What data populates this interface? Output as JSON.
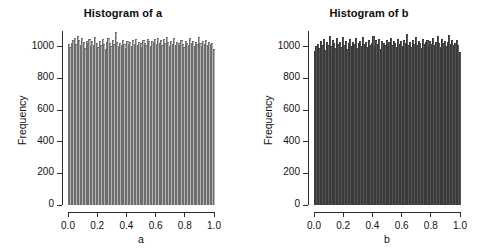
{
  "figure": {
    "background": "#ffffff",
    "width": 492,
    "height": 250,
    "panel_count": 2
  },
  "chart_data": [
    {
      "type": "bar",
      "subtype": "histogram",
      "title": "Histogram of a",
      "xlabel": "a",
      "ylabel": "Frequency",
      "xlim": [
        0.0,
        1.0
      ],
      "ylim": [
        0,
        1100
      ],
      "xticks": [
        "0.0",
        "0.2",
        "0.4",
        "0.6",
        "0.8",
        "1.0"
      ],
      "xtick_values": [
        0.0,
        0.2,
        0.4,
        0.6,
        0.8,
        1.0
      ],
      "yticks": [
        "0",
        "200",
        "400",
        "600",
        "800",
        "1000"
      ],
      "ytick_values": [
        0,
        200,
        400,
        600,
        800,
        1000
      ],
      "grid": false,
      "legend": null,
      "bar_fill": "#b4b4b4",
      "bar_edge": "#6e6e6e",
      "bin_width": 0.01,
      "n_bins": 100,
      "values": [
        1010,
        995,
        1020,
        1038,
        1052,
        1012,
        1060,
        1035,
        1004,
        1048,
        1022,
        986,
        1028,
        1015,
        1043,
        1001,
        1030,
        1008,
        1055,
        1018,
        994,
        1032,
        1007,
        1041,
        1013,
        981,
        1026,
        1049,
        1016,
        1002,
        1036,
        1010,
        1088,
        1024,
        999,
        1021,
        1005,
        1040,
        1014,
        988,
        1031,
        1009,
        1023,
        996,
        1034,
        1011,
        1046,
        1003,
        1027,
        1019,
        992,
        1037,
        1017,
        1006,
        1042,
        1029,
        1000,
        1033,
        1025,
        1045,
        1012,
        1051,
        1020,
        1039,
        1008,
        1044,
        1016,
        1056,
        1022,
        998,
        1030,
        1013,
        1047,
        1005,
        1026,
        1018,
        1003,
        1035,
        1011,
        990,
        1028,
        1021,
        1007,
        1050,
        1015,
        1032,
        1002,
        1024,
        1009,
        1058,
        1019,
        1001,
        1029,
        1014,
        1040,
        1006,
        1023,
        1010,
        1017,
        978
      ]
    },
    {
      "type": "bar",
      "subtype": "histogram",
      "title": "Histogram of b",
      "xlabel": "b",
      "ylabel": "Frequency",
      "xlim": [
        0.0,
        1.0
      ],
      "ylim": [
        0,
        1100
      ],
      "xticks": [
        "0.0",
        "0.2",
        "0.4",
        "0.6",
        "0.8",
        "1.0"
      ],
      "xtick_values": [
        0.0,
        0.2,
        0.4,
        0.6,
        0.8,
        1.0
      ],
      "yticks": [
        "0",
        "200",
        "400",
        "600",
        "800",
        "1000"
      ],
      "ytick_values": [
        0,
        200,
        400,
        600,
        800,
        1000
      ],
      "grid": false,
      "legend": null,
      "bar_fill": "#555555",
      "bar_edge": "#3a3a3a",
      "bin_width": 0.01,
      "n_bins": 100,
      "values": [
        968,
        996,
        1012,
        985,
        1031,
        1003,
        1044,
        975,
        1022,
        1008,
        1065,
        998,
        1036,
        1017,
        989,
        1050,
        1011,
        1027,
        993,
        1058,
        1006,
        1033,
        980,
        1019,
        1041,
        1002,
        1024,
        1009,
        1047,
        987,
        1015,
        1030,
        999,
        1053,
        1013,
        1026,
        991,
        1038,
        1005,
        1021,
        1062,
        1000,
        1034,
        1010,
        1045,
        983,
        1028,
        1016,
        1004,
        1039,
        997,
        1023,
        1048,
        1007,
        1032,
        1018,
        990,
        1042,
        1014,
        1029,
        1001,
        1035,
        1020,
        1072,
        1008,
        1025,
        994,
        1040,
        1012,
        1055,
        1003,
        1031,
        1017,
        986,
        1046,
        1009,
        1022,
        1037,
        1000,
        1028,
        1013,
        1051,
        1005,
        1026,
        1060,
        1019,
        992,
        1043,
        1015,
        1030,
        1002,
        1024,
        1068,
        1011,
        1036,
        1007,
        1021,
        1038,
        1006,
        958
      ]
    }
  ]
}
